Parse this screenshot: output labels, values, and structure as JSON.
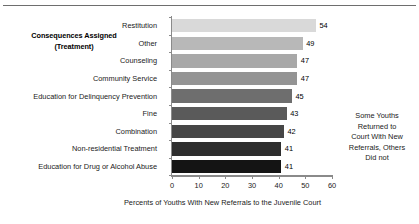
{
  "chart_data": {
    "type": "bar",
    "orientation": "horizontal",
    "title": "",
    "ylabel": "Consequences Assigned (Treatment)",
    "ylabel_line1": "Consequences Assigned",
    "ylabel_line2": "(Treatment)",
    "xlabel": "Percents of  Youths  With New Referrals to the Juvenile Court",
    "xlim": [
      0,
      60
    ],
    "xticks": [
      0,
      10,
      20,
      30,
      40,
      50,
      60
    ],
    "grid": false,
    "legend": "none",
    "categories": [
      "Restitution",
      "Other",
      "Counseling",
      "Community Service",
      "Education for Delinquency Prevention",
      "Fine",
      "Combination",
      "Non-residential Treatment",
      "Education for Drug or Alcohol Abuse"
    ],
    "values": [
      54,
      49,
      47,
      47,
      45,
      43,
      42,
      41,
      41
    ],
    "bar_colors": [
      "#d9d9d9",
      "#b8b8b8",
      "#a8a8a8",
      "#949494",
      "#6e6e6e",
      "#5a5a5a",
      "#464646",
      "#2e2e2e",
      "#141414"
    ],
    "annotations": [
      {
        "text": "Some Youths Returned to Court With New Referrals, Others Did not",
        "lines": [
          "Some Youths",
          "Returned to",
          "Court With New",
          "Referrals, Others",
          "Did not"
        ]
      }
    ]
  }
}
